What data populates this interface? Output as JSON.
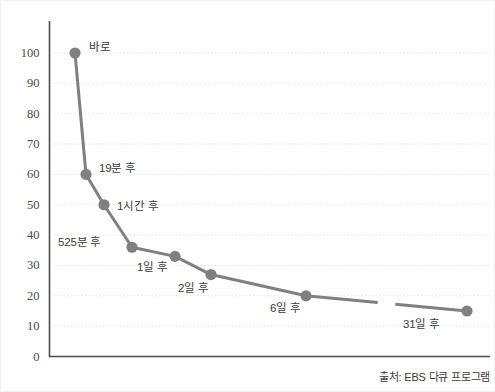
{
  "chart_data": {
    "type": "line",
    "title": "",
    "subtitle": "",
    "xlabel": "",
    "ylabel": "",
    "ylim": [
      0,
      100
    ],
    "yticks": [
      0,
      10,
      20,
      30,
      40,
      50,
      60,
      70,
      80,
      90,
      100
    ],
    "ytick_labels": [
      "0",
      "10",
      "20",
      "30",
      "40",
      "50",
      "60",
      "70",
      "80",
      "90",
      "100"
    ],
    "grid": true,
    "grid_style": "dotted-horizontal",
    "legend": "none",
    "axis_break": true,
    "axis_break_note": "line gap between '6일 후' and '31일 후'",
    "categories": [
      "바로",
      "19분 후",
      "1시간 후",
      "525분 후",
      "1일 후",
      "2일 후",
      "6일 후",
      "31일 후"
    ],
    "values": [
      100,
      60,
      50,
      36,
      33,
      27,
      20,
      15
    ],
    "series": [
      {
        "name": "기억 보유율",
        "values": [
          100,
          60,
          50,
          36,
          33,
          27,
          20,
          15
        ]
      }
    ],
    "points": [
      {
        "label": "바로",
        "value": 100,
        "px": 74,
        "label_dx": 14,
        "label_dy": -5
      },
      {
        "label": "19분 후",
        "value": 60,
        "px": 85,
        "label_dx": 13,
        "label_dy": -5
      },
      {
        "label": "1시간 후",
        "value": 50,
        "px": 103,
        "label_dx": 13,
        "label_dy": 2
      },
      {
        "label": "525분 후",
        "value": 36,
        "px": 131,
        "label_dx": -74,
        "label_dy": -4
      },
      {
        "label": "1일 후",
        "value": 33,
        "px": 174,
        "label_dx": -38,
        "label_dy": 12
      },
      {
        "label": "2일 후",
        "value": 27,
        "px": 210,
        "label_dx": -33,
        "label_dy": 14
      },
      {
        "label": "6일 후",
        "value": 20,
        "px": 305,
        "label_dx": -36,
        "label_dy": 13
      },
      {
        "label": "31일 후",
        "value": 15,
        "px": 466,
        "label_dx": -64,
        "label_dy": 14
      }
    ],
    "colors": {
      "line": "#808080",
      "marker": "#808080",
      "axis": "#4d4d4d",
      "grid": "#e3e3e3",
      "tick_text": "#4a4a4a",
      "label_text": "#3b3b3b",
      "background": "#ffffff"
    }
  },
  "source": {
    "text": "출처: EBS 다큐 프로그램"
  }
}
